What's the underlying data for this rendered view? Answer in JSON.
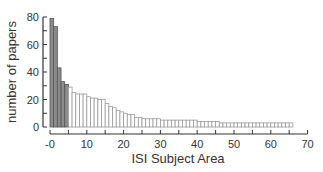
{
  "chart_data": {
    "type": "bar",
    "title": "",
    "xlabel": "ISI Subject Area",
    "ylabel": "number of papers",
    "xlim": [
      0,
      70
    ],
    "ylim": [
      0,
      80
    ],
    "xticks": [
      0,
      10,
      20,
      30,
      40,
      50,
      60,
      70
    ],
    "xtick_labels": [
      "-0",
      "10",
      "20",
      "30",
      "40",
      "50",
      "60",
      "70"
    ],
    "xminor_step": 5,
    "yticks": [
      0,
      20,
      40,
      60,
      80
    ],
    "yminor_step": 10,
    "grid": false,
    "legend": null,
    "highlighted_count": 5,
    "colors": {
      "highlight": "#8c8c8c",
      "normal": "#ffffff",
      "edge_dark": "#555555",
      "edge_light": "#9a9a9a",
      "axis": "#333333"
    },
    "categories": [
      1,
      2,
      3,
      4,
      5,
      6,
      7,
      8,
      9,
      10,
      11,
      12,
      13,
      14,
      15,
      16,
      17,
      18,
      19,
      20,
      21,
      22,
      23,
      24,
      25,
      26,
      27,
      28,
      29,
      30,
      31,
      32,
      33,
      34,
      35,
      36,
      37,
      38,
      39,
      40,
      41,
      42,
      43,
      44,
      45,
      46,
      47,
      48,
      49,
      50,
      51,
      52,
      53,
      54,
      55,
      56,
      57,
      58,
      59,
      60,
      61,
      62,
      63,
      64,
      65,
      66
    ],
    "values": [
      79,
      73,
      43,
      33,
      31,
      29,
      25,
      24,
      24,
      24,
      22,
      21,
      21,
      20,
      20,
      17,
      15,
      14,
      12,
      11,
      10,
      9,
      9,
      7,
      7,
      6,
      6,
      6,
      6,
      6,
      5,
      5,
      5,
      5,
      5,
      5,
      5,
      5,
      5,
      5,
      4,
      4,
      4,
      4,
      4,
      4,
      3,
      3,
      3,
      3,
      3,
      3,
      3,
      3,
      3,
      3,
      3,
      3,
      3,
      3,
      3,
      3,
      3,
      3,
      3,
      3
    ]
  }
}
